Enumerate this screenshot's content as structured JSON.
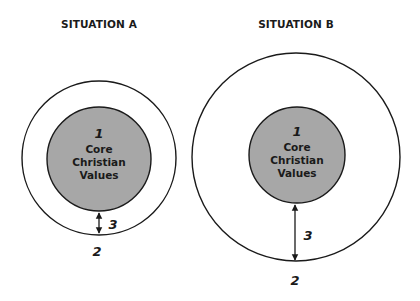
{
  "diagram": {
    "colors": {
      "background": "#ffffff",
      "stroke": "#1a1a1a",
      "core_fill": "#a7a7a7"
    },
    "situations": [
      {
        "title": "SITUATION A",
        "core_number": "1",
        "core_lines": [
          "Core",
          "Christian",
          "Values"
        ],
        "outer_label": "2",
        "distance_label": "3",
        "geometry": {
          "cx": 99,
          "cy": 158,
          "outer_r": 77,
          "inner_r": 52
        }
      },
      {
        "title": "SITUATION B",
        "core_number": "1",
        "core_lines": [
          "Core",
          "Christian",
          "Values"
        ],
        "outer_label": "2",
        "distance_label": "3",
        "geometry": {
          "cx": 296,
          "cy": 157,
          "outer_r": 104,
          "inner_r": 48
        }
      }
    ]
  }
}
